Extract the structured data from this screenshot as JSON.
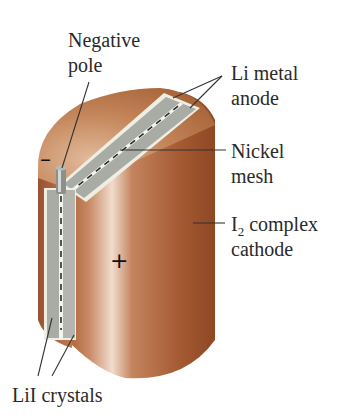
{
  "diagram": {
    "labels": {
      "negative_pole": [
        "Negative",
        "pole"
      ],
      "anode": [
        "Li metal",
        "anode"
      ],
      "mesh": [
        "Nickel",
        "mesh"
      ],
      "cathode_main": "I",
      "cathode_sub": "2",
      "cathode_rest": " complex",
      "cathode_line2": "cathode",
      "crystals": "LiI crystals"
    },
    "signs": {
      "negative": "–",
      "positive": "+"
    },
    "colors": {
      "body_brown": "#a65a32",
      "body_light": "#e8c9b4",
      "top_face": "#c98a62",
      "anode_gray": "#a8aaa4",
      "crystal_cream": "#eeede0",
      "leader": "#333333"
    }
  }
}
